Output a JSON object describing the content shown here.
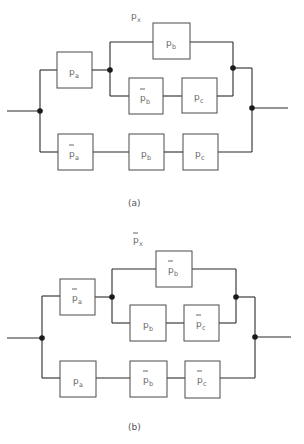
{
  "diagrams": [
    {
      "id": "a",
      "title": {
        "symbol": "p",
        "subscript": "x",
        "complement": false
      },
      "caption": "(a)",
      "branches": {
        "upper": {
          "series_block": {
            "symbol": "p",
            "subscript": "a",
            "complement": false
          },
          "parallel_top": {
            "symbol": "p",
            "subscript": "b",
            "complement": false
          },
          "parallel_bottom": [
            {
              "symbol": "p",
              "subscript": "b",
              "complement": true
            },
            {
              "symbol": "p",
              "subscript": "c",
              "complement": false
            }
          ]
        },
        "lower": [
          {
            "symbol": "p",
            "subscript": "a",
            "complement": true
          },
          {
            "symbol": "p",
            "subscript": "b",
            "complement": false
          },
          {
            "symbol": "p",
            "subscript": "c",
            "complement": false
          }
        ]
      }
    },
    {
      "id": "b",
      "title": {
        "symbol": "p",
        "subscript": "x",
        "complement": true
      },
      "caption": "(b)",
      "branches": {
        "upper": {
          "series_block": {
            "symbol": "p",
            "subscript": "a",
            "complement": true
          },
          "parallel_top": {
            "symbol": "p",
            "subscript": "b",
            "complement": true
          },
          "parallel_bottom": [
            {
              "symbol": "p",
              "subscript": "b",
              "complement": false
            },
            {
              "symbol": "p",
              "subscript": "c",
              "complement": true
            }
          ]
        },
        "lower": [
          {
            "symbol": "p",
            "subscript": "a",
            "complement": false
          },
          {
            "symbol": "p",
            "subscript": "b",
            "complement": true
          },
          {
            "symbol": "p",
            "subscript": "c",
            "complement": true
          }
        ]
      }
    }
  ]
}
